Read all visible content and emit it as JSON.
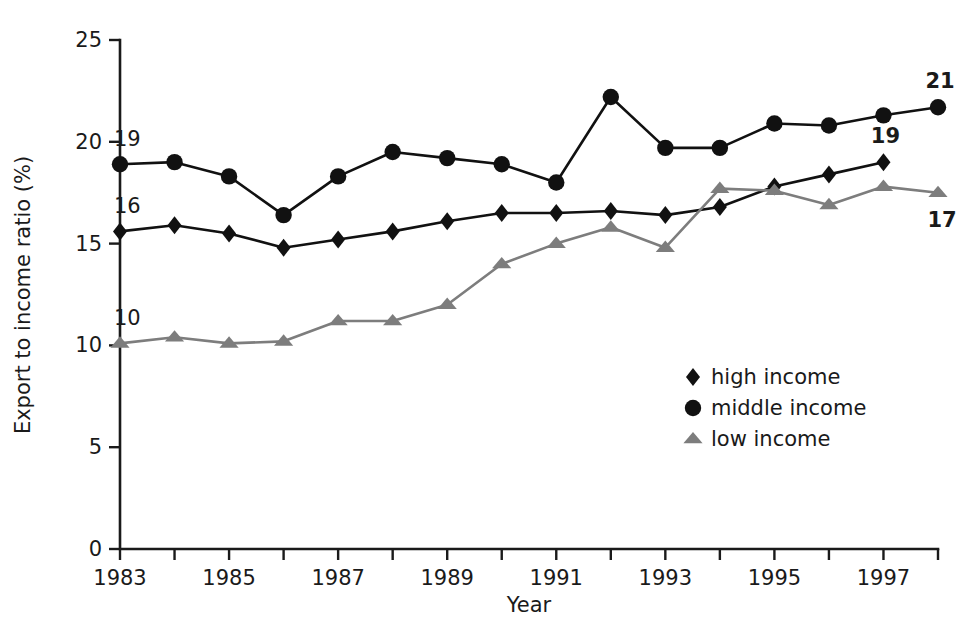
{
  "chart_data": {
    "type": "line",
    "title": "",
    "subtitle": "",
    "xlabel": "Year",
    "ylabel": "Export to income ratio (%)",
    "xlim": [
      1983,
      1998
    ],
    "ylim": [
      0,
      25
    ],
    "ytick_labels": [
      "0",
      "5",
      "10",
      "15",
      "20",
      "25"
    ],
    "ytick_values": [
      0,
      5,
      10,
      15,
      20,
      25
    ],
    "xtick_labels": [
      "1983",
      "1985",
      "1987",
      "1989",
      "1991",
      "1993",
      "1995",
      "1997"
    ],
    "xtick_values": [
      1983,
      1985,
      1987,
      1989,
      1991,
      1993,
      1995,
      1997
    ],
    "x_minor_ticks": [
      1984,
      1986,
      1988,
      1990,
      1992,
      1994,
      1996,
      1998
    ],
    "grid": false,
    "legend_position": "center-right",
    "x": [
      1983,
      1984,
      1985,
      1986,
      1987,
      1988,
      1989,
      1990,
      1991,
      1992,
      1993,
      1994,
      1995,
      1996,
      1997,
      1998
    ],
    "series": [
      {
        "name": "high income",
        "marker": "diamond",
        "color": "#111111",
        "values": [
          15.6,
          15.9,
          15.5,
          14.8,
          15.2,
          15.6,
          16.1,
          16.5,
          16.5,
          16.6,
          16.4,
          16.8,
          17.8,
          18.4,
          19.0,
          null
        ],
        "start_label": "16",
        "end_label": "19"
      },
      {
        "name": "middle income",
        "marker": "circle",
        "color": "#111111",
        "values": [
          18.9,
          19.0,
          18.3,
          16.4,
          18.3,
          19.5,
          19.2,
          18.9,
          18.0,
          22.2,
          19.7,
          19.7,
          20.9,
          20.8,
          21.3,
          21.7
        ],
        "start_label": "19",
        "end_label": "21"
      },
      {
        "name": "low income",
        "marker": "triangle",
        "color": "#7d7d7d",
        "values": [
          10.1,
          10.4,
          10.1,
          10.2,
          11.2,
          11.2,
          12.0,
          14.0,
          15.0,
          15.8,
          14.8,
          17.7,
          17.6,
          16.9,
          17.8,
          17.5
        ],
        "start_label": "10",
        "end_label": "17"
      }
    ],
    "annotations": [
      {
        "text": "19",
        "series": "middle income",
        "position": "start-above",
        "value": 19
      },
      {
        "text": "16",
        "series": "high income",
        "position": "start-above",
        "value": 16
      },
      {
        "text": "10",
        "series": "low income",
        "position": "start-above",
        "value": 10
      },
      {
        "text": "21",
        "series": "middle income",
        "position": "end-above",
        "value": 21
      },
      {
        "text": "19",
        "series": "high income",
        "position": "end-above",
        "value": 19
      },
      {
        "text": "17",
        "series": "low income",
        "position": "end-below",
        "value": 17
      }
    ]
  },
  "legend": {
    "items": [
      {
        "label": "high income",
        "marker": "diamond",
        "color": "#111111"
      },
      {
        "label": "middle income",
        "marker": "circle",
        "color": "#111111"
      },
      {
        "label": "low income",
        "marker": "triangle",
        "color": "#7d7d7d"
      }
    ]
  },
  "colors": {
    "dark_series": "#111111",
    "gray_series": "#7d7d7d",
    "axis": "#1a1a1a",
    "background": "#ffffff"
  }
}
